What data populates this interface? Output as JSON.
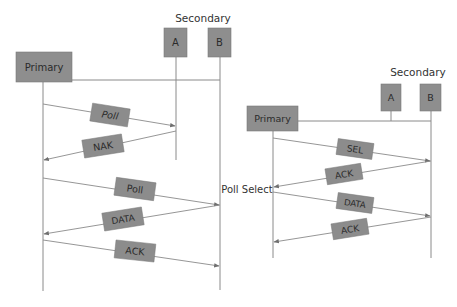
{
  "colors": {
    "node_fill": "#8e8e8e",
    "line": "#8a8a8a",
    "text": "#2b2b2b",
    "background": "#ffffff"
  },
  "left_diagram": {
    "secondary_label": "Secondary",
    "primary_label": "Primary",
    "stations": [
      "A",
      "B"
    ],
    "messages": [
      {
        "label": "Poll",
        "from": "Primary",
        "to": "A"
      },
      {
        "label": "NAK",
        "from": "A",
        "to": "Primary"
      },
      {
        "label": "Poll",
        "from": "Primary",
        "to": "B"
      },
      {
        "label": "DATA",
        "from": "B",
        "to": "Primary"
      },
      {
        "label": "ACK",
        "from": "Primary",
        "to": "B"
      }
    ]
  },
  "right_diagram": {
    "title": "Poll Select",
    "secondary_label": "Secondary",
    "primary_label": "Primary",
    "stations": [
      "A",
      "B"
    ],
    "messages": [
      {
        "label": "SEL",
        "from": "Primary",
        "to": "B"
      },
      {
        "label": "ACK",
        "from": "B",
        "to": "Primary"
      },
      {
        "label": "DATA",
        "from": "Primary",
        "to": "B"
      },
      {
        "label": "ACK",
        "from": "B",
        "to": "Primary"
      }
    ]
  }
}
